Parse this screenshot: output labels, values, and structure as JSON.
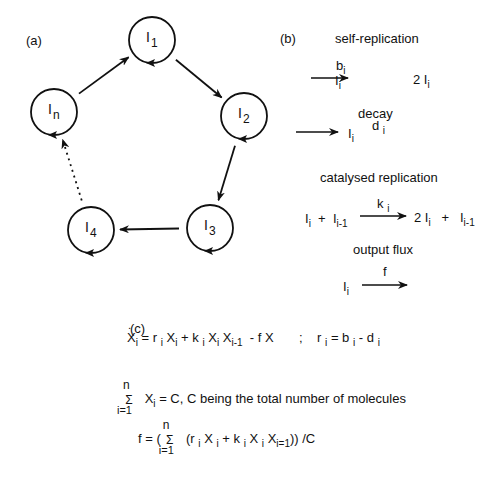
{
  "panel_a": {
    "label": "(a)",
    "nodes": [
      {
        "id": "I1",
        "base": "I",
        "sub": "1",
        "cx": 152,
        "cy": 40
      },
      {
        "id": "I2",
        "base": "I",
        "sub": "2",
        "cx": 244,
        "cy": 116
      },
      {
        "id": "I3",
        "base": "I",
        "sub": "3",
        "cx": 210,
        "cy": 228
      },
      {
        "id": "I4",
        "base": "I",
        "sub": "4",
        "cx": 91,
        "cy": 230
      },
      {
        "id": "In",
        "base": "I",
        "sub": "n",
        "cx": 54,
        "cy": 112
      }
    ],
    "node_radius": 23,
    "edges": [
      {
        "from": "In",
        "to": "I1",
        "style": "solid"
      },
      {
        "from": "I1",
        "to": "I2",
        "style": "solid"
      },
      {
        "from": "I2",
        "to": "I3",
        "style": "solid"
      },
      {
        "from": "I3",
        "to": "I4",
        "style": "solid"
      },
      {
        "from": "I4",
        "to": "In",
        "style": "dotted"
      }
    ]
  },
  "panel_b": {
    "label": "(b)",
    "reactions": [
      {
        "title": "self-replication",
        "lhs": "I",
        "lhs_sub": "i",
        "rate": "b",
        "rate_sub": "i",
        "rhs": "2 I",
        "rhs_sub": "i"
      },
      {
        "title": "decay",
        "lhs": "I",
        "lhs_sub": "i",
        "rate": "d",
        "rate_sub": "i",
        "rhs": "",
        "rhs_sub": ""
      },
      {
        "title": "catalysed replication",
        "lhs": "I",
        "lhs_sub": "i",
        "lhs2": "I",
        "lhs2_sub": "i-1",
        "rate": "k",
        "rate_sub": "i",
        "rhs": "2 I",
        "rhs_sub": "i",
        "rhs2": "I",
        "rhs2_sub": "i-1"
      },
      {
        "title": "output flux",
        "lhs": "I",
        "lhs_sub": "i",
        "rate": "f",
        "rate_sub": "",
        "rhs": "",
        "rhs_sub": ""
      }
    ]
  },
  "panel_c": {
    "label": "(c)",
    "eq1": {
      "lhs": "X",
      "lhs_sub": "i",
      "dot": ".",
      "terms": [
        "= r",
        "i",
        "X",
        "i",
        "+ k",
        "i",
        "X",
        "i",
        "X",
        "i-1",
        "- f  X"
      ],
      "sep": ";",
      "r_def": "r",
      "r_sub": "i",
      "r_eq": "= b",
      "b_sub": "i",
      "minus_d": "- d",
      "d_sub": "i"
    },
    "eq2": {
      "sum_top": "n",
      "sum_symbol": "Σ",
      "sum_bottom": "i=1",
      "body": "X",
      "body_sub": "i",
      "rhs": "= C,   C being the total number of molecules"
    },
    "eq3": {
      "lhs": "f = (",
      "sum_top": "n",
      "sum_symbol": "Σ",
      "sum_bottom": "i=1",
      "body": "(r",
      "r_sub": "i",
      "x1": "X",
      "x1_sub": "i",
      "plus_k": "+ k",
      "k_sub": "i",
      "x2": "X",
      "x2_sub": "i",
      "x3": "X",
      "x3_sub": "i=1",
      "tail": ")) /C"
    }
  }
}
